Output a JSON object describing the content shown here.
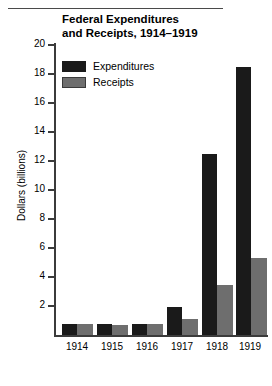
{
  "chart_data": {
    "type": "bar",
    "title": "Federal Expenditures and Receipts, 1914–1919",
    "title_lines": [
      "Federal Expenditures",
      "and Receipts, 1914–1919"
    ],
    "xlabel": "",
    "ylabel": "Dollars (billions)",
    "categories": [
      "1914",
      "1915",
      "1916",
      "1917",
      "1918",
      "1919"
    ],
    "series": [
      {
        "name": "Expenditures",
        "color": "#1a1a1a",
        "values": [
          0.73,
          0.75,
          0.73,
          1.95,
          12.5,
          18.5
        ]
      },
      {
        "name": "Receipts",
        "color": "#6e6e6e",
        "values": [
          0.73,
          0.7,
          0.78,
          1.12,
          3.45,
          5.3
        ]
      }
    ],
    "ylim": [
      0,
      20
    ],
    "yticks": [
      2,
      4,
      6,
      8,
      10,
      12,
      14,
      16,
      18,
      20
    ],
    "ytick_labels": [
      "2",
      "4",
      "6",
      "8",
      "10",
      "12",
      "14",
      "16",
      "18",
      "20"
    ],
    "grid": false,
    "legend_position": "top-left",
    "legend_entries": [
      "Expenditures",
      "Receipts"
    ]
  }
}
